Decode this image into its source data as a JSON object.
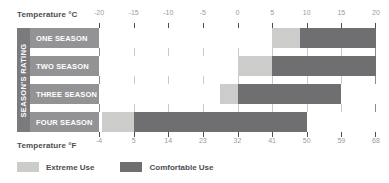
{
  "chart_data": {
    "type": "bar",
    "orientation": "horizontal",
    "title": "",
    "subtitle": "",
    "xlabel": "Temperature °C",
    "xlabel_secondary": "Temperature °F",
    "ylabel": "SEASON'S RATING",
    "xlim": [
      -20,
      20
    ],
    "grid": true,
    "legend_position": "bottom-left",
    "axis_celsius": {
      "caption": "Temperature °C",
      "ticks": [
        -20,
        -15,
        -10,
        -5,
        0,
        5,
        10,
        15,
        20
      ],
      "tick_labels": [
        "-20",
        "-15",
        "-10",
        "-5",
        "0",
        "5",
        "10",
        "15",
        "20"
      ]
    },
    "axis_fahrenheit": {
      "caption": "Temperature °F",
      "ticks": [
        -20,
        -15,
        -10,
        -5,
        0,
        5,
        10,
        15,
        20
      ],
      "tick_labels": [
        "-4",
        "5",
        "14",
        "23",
        "32",
        "41",
        "50",
        "59",
        "68"
      ]
    },
    "categories": [
      "ONE SEASON",
      "TWO SEASON",
      "THREE SEASON",
      "FOUR SEASON"
    ],
    "series": [
      {
        "name": "Extreme Use",
        "color": "#cccccb",
        "ranges": [
          {
            "category": "ONE SEASON",
            "start": 5,
            "end": 9
          },
          {
            "category": "TWO SEASON",
            "start": 0,
            "end": 5
          },
          {
            "category": "THREE SEASON",
            "start": -2.5,
            "end": 0
          },
          {
            "category": "FOUR SEASON",
            "start": -19.5,
            "end": -15
          }
        ]
      },
      {
        "name": "Comfortable Use",
        "color": "#6f6f71",
        "ranges": [
          {
            "category": "ONE SEASON",
            "start": 9,
            "end": 20
          },
          {
            "category": "TWO SEASON",
            "start": 5,
            "end": 20
          },
          {
            "category": "THREE SEASON",
            "start": 0,
            "end": 15
          },
          {
            "category": "FOUR SEASON",
            "start": -15,
            "end": 10
          }
        ]
      }
    ],
    "legend": [
      {
        "label": "Extreme Use",
        "color": "#cccccb"
      },
      {
        "label": "Comfortable Use",
        "color": "#6f6f71"
      }
    ]
  }
}
